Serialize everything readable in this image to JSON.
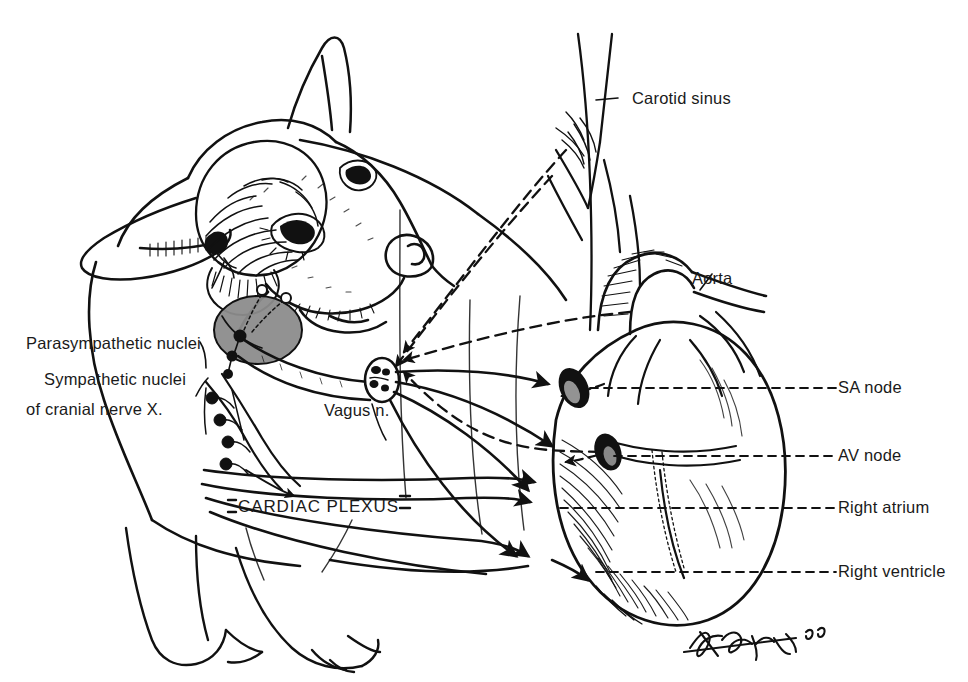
{
  "figure": {
    "background_color": "#ffffff",
    "ink_color": "#111111",
    "shade_color": "#8c8c8c",
    "width": 968,
    "height": 682
  },
  "labels": {
    "parasympathetic_nuclei_line1": "Parasympathetic nuclei",
    "parasympathetic_nuclei_line2": "of cranial nerve X.",
    "sympathetic_nuclei": "Sympathetic nuclei",
    "vagus_nerve": "Vagus n.",
    "cardiac_plexus": "CARDIAC PLEXUS",
    "carotid_sinus": "Carotid sinus",
    "aorta": "Aorta",
    "sa_node": "SA node",
    "av_node": "AV node",
    "right_atrium": "Right atrium",
    "right_ventricle": "Right ventricle"
  },
  "signature": {
    "text": "Kaper '86"
  },
  "legend_semantics": {
    "solid_line": "efferent motor nerve fiber",
    "dashed_line": "afferent sensory nerve fiber",
    "filled_arrowhead": "direction of impulse conduction",
    "black_dot": "ganglion / nucleus cell body"
  }
}
